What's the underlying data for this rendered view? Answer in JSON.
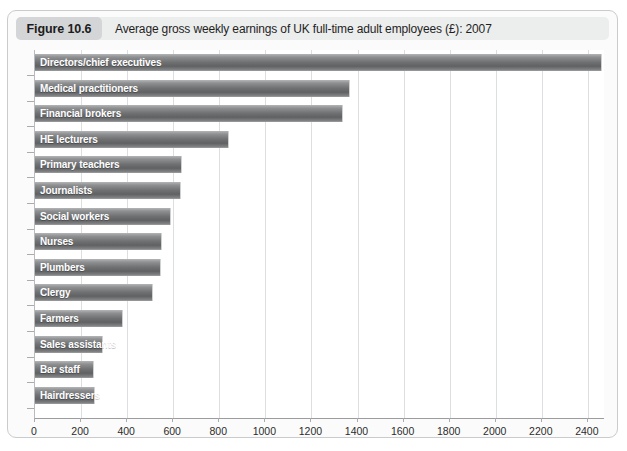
{
  "figure": {
    "badge": "Figure 10.6",
    "caption": "Average gross weekly earnings of UK full-time adult employees (£): 2007"
  },
  "chart_data": {
    "type": "bar",
    "orientation": "horizontal",
    "title": "Average gross weekly earnings of UK full-time adult employees (£): 2007",
    "xlabel": "",
    "ylabel": "",
    "xlim": [
      0,
      2470
    ],
    "grid": true,
    "legend": null,
    "xticks": [
      0,
      200,
      400,
      600,
      800,
      1000,
      1200,
      1400,
      1600,
      1800,
      2000,
      2200,
      2400
    ],
    "xticklabels": [
      "0",
      "200",
      "400",
      "600",
      "800",
      "1000",
      "1200",
      "1400",
      "1600",
      "1800",
      "2000",
      "2200",
      "2400"
    ],
    "categories": [
      "Directors/chief executives",
      "Medical practitioners",
      "Financial brokers",
      "HE lecturers",
      "Primary teachers",
      "Journalists",
      "Social workers",
      "Nurses",
      "Plumbers",
      "Clergy",
      "Farmers",
      "Sales assistants",
      "Bar staff",
      "Hairdressers"
    ],
    "values": [
      2460,
      1368,
      1337,
      843,
      640,
      635,
      591,
      552,
      548,
      513,
      383,
      296,
      257,
      261
    ]
  },
  "colors": {
    "bar_light": "#b3b5b7",
    "bar_dark": "#5f6163",
    "gridline": "#dcdedf",
    "axis": "#9a9c9e",
    "caption_bar": "#eceded",
    "badge": "#d3d5d6",
    "frame_border": "#c9cbcd"
  }
}
